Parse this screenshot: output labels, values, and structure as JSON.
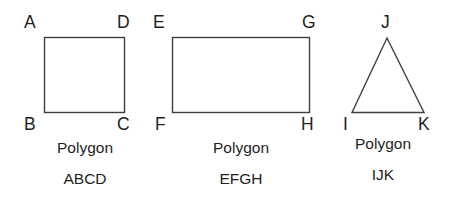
{
  "diagram": {
    "background_color": "#ffffff",
    "stroke_color": "#3f3f3f",
    "text_color": "#231f20",
    "caption_word": "Polygon",
    "figures": [
      {
        "id": "polygon-abcd",
        "shape": "square",
        "caption_line1": "Polygon",
        "caption_line2": "ABCD",
        "vertices": [
          {
            "label": "A",
            "position": "top-left"
          },
          {
            "label": "D",
            "position": "top-right"
          },
          {
            "label": "B",
            "position": "bottom-left"
          },
          {
            "label": "C",
            "position": "bottom-right"
          }
        ]
      },
      {
        "id": "polygon-efgh",
        "shape": "rectangle",
        "caption_line1": "Polygon",
        "caption_line2": "EFGH",
        "vertices": [
          {
            "label": "E",
            "position": "top-left"
          },
          {
            "label": "G",
            "position": "top-right"
          },
          {
            "label": "F",
            "position": "bottom-left"
          },
          {
            "label": "H",
            "position": "bottom-right"
          }
        ]
      },
      {
        "id": "polygon-ijk",
        "shape": "triangle",
        "caption_line1": "Polygon",
        "caption_line2": "IJK",
        "vertices": [
          {
            "label": "J",
            "position": "apex"
          },
          {
            "label": "I",
            "position": "bottom-left"
          },
          {
            "label": "K",
            "position": "bottom-right"
          }
        ]
      }
    ]
  }
}
